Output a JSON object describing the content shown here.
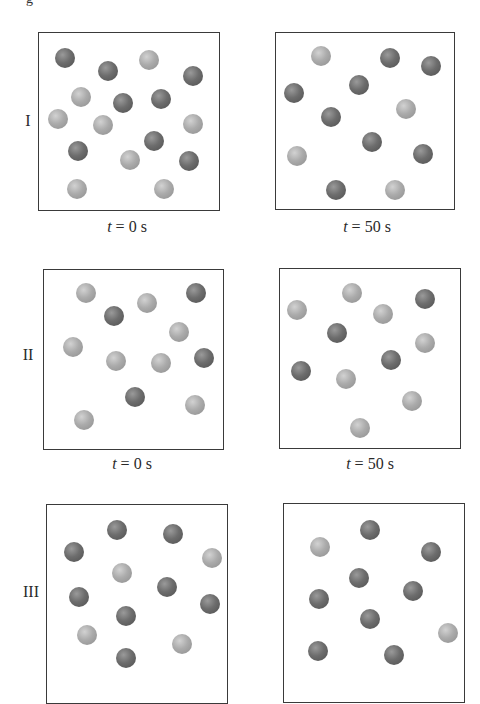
{
  "page": {
    "top_fragment": "g"
  },
  "rows": [
    {
      "label": "I",
      "panels": [
        {
          "time_label_var": "t",
          "time_label_rest": " = 0 s",
          "box": {
            "left": 38,
            "top": 32,
            "width": 182,
            "height": 179
          },
          "balls": [
            {
              "x": 65,
              "y": 58,
              "c": "dark"
            },
            {
              "x": 108,
              "y": 71,
              "c": "dark"
            },
            {
              "x": 149,
              "y": 60,
              "c": "light"
            },
            {
              "x": 193,
              "y": 76,
              "c": "dark"
            },
            {
              "x": 81,
              "y": 97,
              "c": "light"
            },
            {
              "x": 123,
              "y": 103,
              "c": "dark"
            },
            {
              "x": 161,
              "y": 99,
              "c": "dark"
            },
            {
              "x": 58,
              "y": 119,
              "c": "light"
            },
            {
              "x": 103,
              "y": 125,
              "c": "light"
            },
            {
              "x": 193,
              "y": 124,
              "c": "light"
            },
            {
              "x": 154,
              "y": 141,
              "c": "dark"
            },
            {
              "x": 78,
              "y": 151,
              "c": "dark"
            },
            {
              "x": 130,
              "y": 160,
              "c": "light"
            },
            {
              "x": 189,
              "y": 161,
              "c": "dark"
            },
            {
              "x": 77,
              "y": 189,
              "c": "light"
            },
            {
              "x": 164,
              "y": 189,
              "c": "light"
            }
          ]
        },
        {
          "time_label_var": "t",
          "time_label_rest": " = 50 s",
          "box": {
            "left": 275,
            "top": 32,
            "width": 180,
            "height": 178
          },
          "balls": [
            {
              "x": 321,
              "y": 56,
              "c": "light"
            },
            {
              "x": 390,
              "y": 58,
              "c": "dark"
            },
            {
              "x": 431,
              "y": 66,
              "c": "dark"
            },
            {
              "x": 294,
              "y": 93,
              "c": "dark"
            },
            {
              "x": 359,
              "y": 85,
              "c": "dark"
            },
            {
              "x": 406,
              "y": 109,
              "c": "light"
            },
            {
              "x": 331,
              "y": 117,
              "c": "dark"
            },
            {
              "x": 372,
              "y": 142,
              "c": "dark"
            },
            {
              "x": 297,
              "y": 156,
              "c": "light"
            },
            {
              "x": 423,
              "y": 154,
              "c": "dark"
            },
            {
              "x": 336,
              "y": 190,
              "c": "dark"
            },
            {
              "x": 395,
              "y": 190,
              "c": "light"
            }
          ]
        }
      ]
    },
    {
      "label": "II",
      "panels": [
        {
          "time_label_var": "t",
          "time_label_rest": " = 0 s",
          "box": {
            "left": 43,
            "top": 269,
            "width": 181,
            "height": 181
          },
          "balls": [
            {
              "x": 86,
              "y": 293,
              "c": "light"
            },
            {
              "x": 114,
              "y": 316,
              "c": "dark"
            },
            {
              "x": 147,
              "y": 303,
              "c": "light"
            },
            {
              "x": 196,
              "y": 293,
              "c": "dark"
            },
            {
              "x": 179,
              "y": 332,
              "c": "light"
            },
            {
              "x": 73,
              "y": 347,
              "c": "light"
            },
            {
              "x": 116,
              "y": 361,
              "c": "light"
            },
            {
              "x": 161,
              "y": 363,
              "c": "light"
            },
            {
              "x": 204,
              "y": 358,
              "c": "dark"
            },
            {
              "x": 135,
              "y": 397,
              "c": "dark"
            },
            {
              "x": 195,
              "y": 405,
              "c": "light"
            },
            {
              "x": 84,
              "y": 420,
              "c": "light"
            }
          ]
        },
        {
          "time_label_var": "t",
          "time_label_rest": " = 50 s",
          "box": {
            "left": 279,
            "top": 268,
            "width": 182,
            "height": 181
          },
          "balls": [
            {
              "x": 352,
              "y": 293,
              "c": "light"
            },
            {
              "x": 297,
              "y": 310,
              "c": "light"
            },
            {
              "x": 425,
              "y": 299,
              "c": "dark"
            },
            {
              "x": 383,
              "y": 314,
              "c": "light"
            },
            {
              "x": 337,
              "y": 333,
              "c": "dark"
            },
            {
              "x": 425,
              "y": 343,
              "c": "light"
            },
            {
              "x": 391,
              "y": 360,
              "c": "dark"
            },
            {
              "x": 301,
              "y": 371,
              "c": "dark"
            },
            {
              "x": 346,
              "y": 379,
              "c": "light"
            },
            {
              "x": 412,
              "y": 401,
              "c": "light"
            },
            {
              "x": 360,
              "y": 428,
              "c": "light"
            }
          ]
        }
      ]
    },
    {
      "label": "III",
      "panels": [
        {
          "box": {
            "left": 46,
            "top": 504,
            "width": 182,
            "height": 200
          },
          "balls": [
            {
              "x": 117,
              "y": 530,
              "c": "dark"
            },
            {
              "x": 173,
              "y": 534,
              "c": "dark"
            },
            {
              "x": 74,
              "y": 552,
              "c": "dark"
            },
            {
              "x": 212,
              "y": 558,
              "c": "light"
            },
            {
              "x": 122,
              "y": 573,
              "c": "light"
            },
            {
              "x": 167,
              "y": 587,
              "c": "dark"
            },
            {
              "x": 79,
              "y": 597,
              "c": "dark"
            },
            {
              "x": 210,
              "y": 604,
              "c": "dark"
            },
            {
              "x": 126,
              "y": 616,
              "c": "dark"
            },
            {
              "x": 87,
              "y": 635,
              "c": "light"
            },
            {
              "x": 182,
              "y": 644,
              "c": "light"
            },
            {
              "x": 126,
              "y": 658,
              "c": "dark"
            }
          ]
        },
        {
          "box": {
            "left": 283,
            "top": 503,
            "width": 182,
            "height": 200
          },
          "balls": [
            {
              "x": 370,
              "y": 530,
              "c": "dark"
            },
            {
              "x": 320,
              "y": 547,
              "c": "light"
            },
            {
              "x": 431,
              "y": 552,
              "c": "dark"
            },
            {
              "x": 359,
              "y": 578,
              "c": "dark"
            },
            {
              "x": 413,
              "y": 591,
              "c": "dark"
            },
            {
              "x": 319,
              "y": 599,
              "c": "dark"
            },
            {
              "x": 370,
              "y": 619,
              "c": "dark"
            },
            {
              "x": 448,
              "y": 633,
              "c": "light"
            },
            {
              "x": 318,
              "y": 651,
              "c": "dark"
            },
            {
              "x": 394,
              "y": 655,
              "c": "dark"
            }
          ]
        }
      ]
    }
  ],
  "labels_layout": {
    "row_labels": [
      {
        "x": 28,
        "y": 121
      },
      {
        "x": 28,
        "y": 355
      },
      {
        "x": 31,
        "y": 592
      }
    ],
    "time_labels": [
      {
        "x": 127,
        "y": 218
      },
      {
        "x": 367,
        "y": 218
      },
      {
        "x": 132,
        "y": 455
      },
      {
        "x": 370,
        "y": 455
      }
    ]
  },
  "colors": {
    "dark_ball": "#6d6d6d",
    "light_ball": "#ababab",
    "box_border": "#3a3a3a"
  }
}
